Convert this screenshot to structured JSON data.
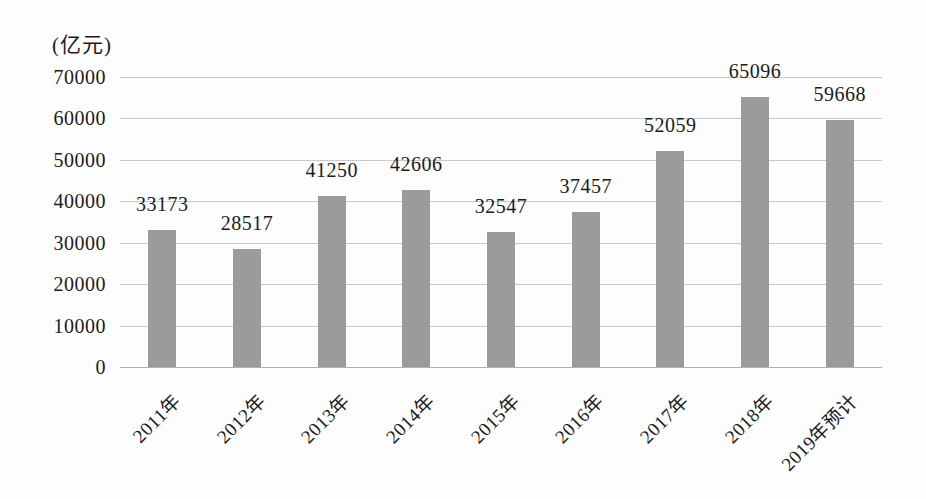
{
  "chart_data": {
    "type": "bar",
    "title": "",
    "unit_label": "(亿元)",
    "categories": [
      "2011年",
      "2012年",
      "2013年",
      "2014年",
      "2015年",
      "2016年",
      "2017年",
      "2018年",
      "2019年预计"
    ],
    "values": [
      33173,
      28517,
      41250,
      42606,
      32547,
      37457,
      52059,
      65096,
      59668
    ],
    "data_labels": [
      "33173",
      "28517",
      "41250",
      "42606",
      "32547",
      "37457",
      "52059",
      "65096",
      "59668"
    ],
    "ylabel": "(亿元)",
    "ylim": [
      0,
      70000
    ],
    "yticks": [
      0,
      10000,
      20000,
      30000,
      40000,
      50000,
      60000,
      70000
    ],
    "ytick_labels": [
      "0",
      "10000",
      "20000",
      "30000",
      "40000",
      "50000",
      "60000",
      "70000"
    ],
    "grid": true,
    "legend": null,
    "colors": {
      "bar": "#9b9b9b",
      "gridline": "#c9c9c9",
      "baseline": "#b0b0b0",
      "text": "#1b1b1b",
      "background": "#fdfdfd"
    }
  }
}
